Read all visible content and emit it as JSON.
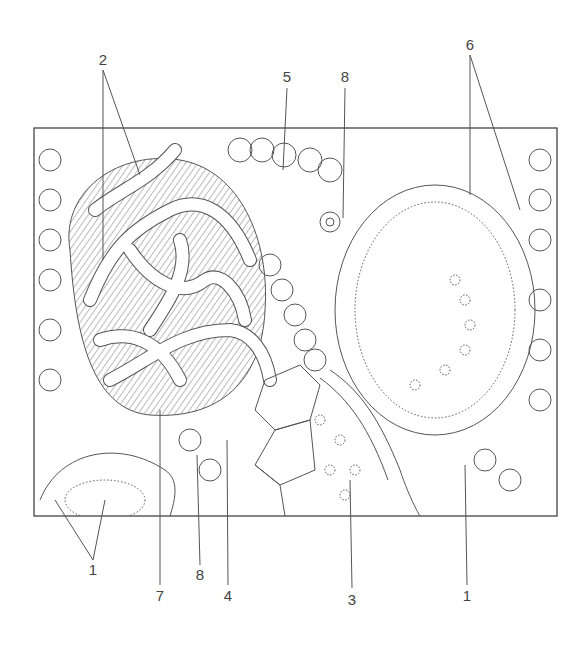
{
  "figure": {
    "labels": [
      {
        "id": "l2",
        "text": "2",
        "x": 103,
        "y": 58
      },
      {
        "id": "l5",
        "text": "5",
        "x": 287,
        "y": 75
      },
      {
        "id": "l8top",
        "text": "8",
        "x": 345,
        "y": 75
      },
      {
        "id": "l6",
        "text": "6",
        "x": 470,
        "y": 37
      },
      {
        "id": "l1left",
        "text": "1",
        "x": 93,
        "y": 567
      },
      {
        "id": "l8bot",
        "text": "8",
        "x": 200,
        "y": 575
      },
      {
        "id": "l7",
        "text": "7",
        "x": 160,
        "y": 595
      },
      {
        "id": "l4",
        "text": "4",
        "x": 228,
        "y": 595
      },
      {
        "id": "l3",
        "text": "3",
        "x": 352,
        "y": 598
      },
      {
        "id": "l1right",
        "text": "1",
        "x": 467,
        "y": 595
      }
    ]
  }
}
